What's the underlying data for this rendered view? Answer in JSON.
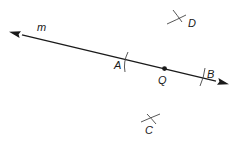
{
  "diagram": {
    "line": {
      "name": "m",
      "label": "m"
    },
    "points": {
      "A": {
        "label": "A"
      },
      "Q": {
        "label": "Q"
      },
      "B": {
        "label": "B"
      },
      "C": {
        "label": "C"
      },
      "D": {
        "label": "D"
      }
    }
  },
  "colors": {
    "ink": "#1a1a1a",
    "construction": "#444444",
    "background": "#ffffff"
  }
}
